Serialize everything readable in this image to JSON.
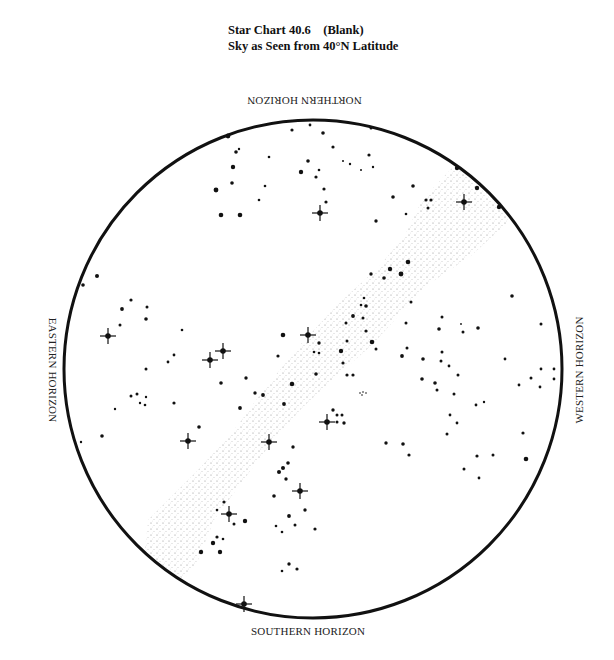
{
  "title": {
    "line1": "Star Chart 40.6    (Blank)",
    "line2": "Sky as Seen from 40°N Latitude"
  },
  "horizons": {
    "north": "NORTHERN HORIZON",
    "south": "SOUTHERN HORIZON",
    "east": "EASTERN HORIZON",
    "west": "WESTERN HORIZON"
  },
  "colors": {
    "ink": "#111111",
    "milky_way": "#9a9a9a",
    "background": "#ffffff"
  },
  "chart_data": {
    "type": "scatter",
    "xlabel": "",
    "ylabel": "",
    "horizon_circle": {
      "cx": 313,
      "cy": 369,
      "r": 249
    },
    "labels": [
      "NORTHERN HORIZON",
      "SOUTHERN HORIZON",
      "EASTERN HORIZON",
      "WESTERN HORIZON"
    ],
    "milky_way_band": [
      [
        148,
        520
      ],
      [
        200,
        468
      ],
      [
        238,
        425
      ],
      [
        262,
        392
      ],
      [
        300,
        345
      ],
      [
        340,
        302
      ],
      [
        378,
        268
      ],
      [
        405,
        235
      ],
      [
        422,
        200
      ],
      [
        452,
        168
      ],
      [
        478,
        178
      ],
      [
        505,
        200
      ],
      [
        508,
        222
      ],
      [
        472,
        255
      ],
      [
        432,
        282
      ],
      [
        402,
        312
      ],
      [
        372,
        345
      ],
      [
        332,
        380
      ],
      [
        302,
        408
      ],
      [
        272,
        442
      ],
      [
        242,
        482
      ],
      [
        214,
        520
      ],
      [
        198,
        560
      ],
      [
        182,
        582
      ],
      [
        160,
        570
      ],
      [
        145,
        550
      ]
    ],
    "bright_stars": [
      [
        320,
        213
      ],
      [
        464,
        202
      ],
      [
        108,
        336
      ],
      [
        308,
        335
      ],
      [
        210,
        360
      ],
      [
        223,
        351
      ],
      [
        188,
        441
      ],
      [
        269,
        442
      ],
      [
        327,
        422
      ],
      [
        300,
        491
      ],
      [
        229,
        514
      ],
      [
        244,
        604
      ]
    ],
    "stars": [
      [
        228,
        136,
        2.4
      ],
      [
        292,
        130,
        1.6
      ],
      [
        310,
        125,
        1.4
      ],
      [
        323,
        133,
        1.8
      ],
      [
        371,
        128,
        1.5
      ],
      [
        236,
        152,
        1.8
      ],
      [
        239,
        149,
        1.2
      ],
      [
        269,
        157,
        1.3
      ],
      [
        308,
        161,
        1.8
      ],
      [
        233,
        167,
        2.2
      ],
      [
        301,
        172,
        2.2
      ],
      [
        319,
        170,
        1.3
      ],
      [
        316,
        177,
        1.6
      ],
      [
        333,
        147,
        1.6
      ],
      [
        343,
        161,
        1
      ],
      [
        350,
        164,
        1.2
      ],
      [
        369,
        155,
        1.6
      ],
      [
        373,
        167,
        1.2
      ],
      [
        361,
        170,
        1
      ],
      [
        232,
        183,
        1.8
      ],
      [
        216,
        190,
        2.4
      ],
      [
        265,
        186,
        1.3
      ],
      [
        324,
        189,
        1.6
      ],
      [
        259,
        200,
        1.3
      ],
      [
        326,
        202,
        1.6
      ],
      [
        221,
        215,
        2.3
      ],
      [
        240,
        215,
        2.3
      ],
      [
        376,
        221,
        1.7
      ],
      [
        393,
        197,
        1.8
      ],
      [
        413,
        186,
        1.8
      ],
      [
        426,
        200,
        1.6
      ],
      [
        431,
        200,
        1.6
      ],
      [
        428,
        208,
        1.5
      ],
      [
        406,
        214,
        1.3
      ],
      [
        457,
        168,
        2.2
      ],
      [
        477,
        188,
        2.2
      ],
      [
        499,
        207,
        2.2
      ],
      [
        408,
        262,
        2.3
      ],
      [
        390,
        269,
        2.2
      ],
      [
        401,
        274,
        2.4
      ],
      [
        371,
        274,
        1.7
      ],
      [
        384,
        278,
        1.8
      ],
      [
        411,
        302,
        1.5
      ],
      [
        364,
        298,
        1.3
      ],
      [
        361,
        305,
        1.3
      ],
      [
        366,
        306,
        1.8
      ],
      [
        353,
        316,
        1.9
      ],
      [
        363,
        318,
        1.5
      ],
      [
        346,
        323,
        1.5
      ],
      [
        366,
        331,
        1.6
      ],
      [
        406,
        323,
        1.5
      ],
      [
        372,
        342,
        2.3
      ],
      [
        376,
        349,
        1.5
      ],
      [
        347,
        341,
        1.5
      ],
      [
        341,
        351,
        2.2
      ],
      [
        319,
        343,
        1.7
      ],
      [
        314,
        352,
        1.3
      ],
      [
        319,
        353,
        1.3
      ],
      [
        343,
        363,
        1.6
      ],
      [
        316,
        374,
        1.8
      ],
      [
        347,
        375,
        1.6
      ],
      [
        353,
        375,
        1.6
      ],
      [
        283,
        335,
        2.3
      ],
      [
        278,
        356,
        1.6
      ],
      [
        292,
        384,
        2.3
      ],
      [
        255,
        393,
        1.7
      ],
      [
        263,
        395,
        1.9
      ],
      [
        284,
        404,
        1.9
      ],
      [
        240,
        408,
        1.9
      ],
      [
        246,
        378,
        1.7
      ],
      [
        97,
        276,
        2
      ],
      [
        83,
        285,
        1.8
      ],
      [
        131,
        300,
        1.6
      ],
      [
        122,
        309,
        1.9
      ],
      [
        147,
        307,
        1.5
      ],
      [
        146,
        319,
        1.8
      ],
      [
        120,
        325,
        1.5
      ],
      [
        182,
        330,
        1.3
      ],
      [
        174,
        355,
        1.4
      ],
      [
        168,
        362,
        1.4
      ],
      [
        146,
        369,
        1.5
      ],
      [
        221,
        383,
        1.8
      ],
      [
        131,
        396,
        1.5
      ],
      [
        137,
        394,
        1.5
      ],
      [
        146,
        397,
        1.2
      ],
      [
        140,
        403,
        1.2
      ],
      [
        145,
        405,
        1.3
      ],
      [
        174,
        403,
        1.6
      ],
      [
        115,
        409,
        1.2
      ],
      [
        102,
        436,
        1.8
      ],
      [
        81,
        442,
        1.2
      ],
      [
        199,
        427,
        1.8
      ],
      [
        293,
        447,
        1.7
      ],
      [
        333,
        410,
        1.7
      ],
      [
        337,
        415,
        1.5
      ],
      [
        342,
        415,
        1.5
      ],
      [
        337,
        422,
        1.5
      ],
      [
        344,
        423,
        1.7
      ],
      [
        360,
        393,
        0.8
      ],
      [
        363,
        392,
        0.8
      ],
      [
        366,
        393,
        0.8
      ],
      [
        362,
        395,
        0.8
      ],
      [
        288,
        463,
        1.8
      ],
      [
        283,
        468,
        2
      ],
      [
        279,
        472,
        2
      ],
      [
        286,
        479,
        1.7
      ],
      [
        274,
        496,
        1.8
      ],
      [
        305,
        510,
        1.7
      ],
      [
        289,
        516,
        1.9
      ],
      [
        276,
        526,
        1.3
      ],
      [
        282,
        532,
        1.3
      ],
      [
        295,
        525,
        1.5
      ],
      [
        315,
        529,
        1.6
      ],
      [
        289,
        564,
        1.7
      ],
      [
        282,
        571,
        1.3
      ],
      [
        297,
        569,
        1.6
      ],
      [
        224,
        502,
        1.6
      ],
      [
        217,
        510,
        1.3
      ],
      [
        245,
        521,
        2.2
      ],
      [
        234,
        524,
        1.5
      ],
      [
        217,
        537,
        1.6
      ],
      [
        223,
        539,
        1.3
      ],
      [
        213,
        543,
        2.2
      ],
      [
        201,
        552,
        2.2
      ],
      [
        220,
        552,
        2.2
      ],
      [
        512,
        296,
        1.8
      ],
      [
        541,
        324,
        1.5
      ],
      [
        478,
        328,
        1.8
      ],
      [
        442,
        317,
        1.5
      ],
      [
        439,
        329,
        1.8
      ],
      [
        463,
        332,
        1.5
      ],
      [
        461,
        324,
        0.9
      ],
      [
        407,
        348,
        1.5
      ],
      [
        402,
        356,
        1.9
      ],
      [
        423,
        359,
        1.8
      ],
      [
        442,
        352,
        1.5
      ],
      [
        441,
        361,
        1.5
      ],
      [
        449,
        366,
        1.4
      ],
      [
        458,
        375,
        1.5
      ],
      [
        505,
        359,
        1.4
      ],
      [
        531,
        378,
        1.5
      ],
      [
        541,
        369,
        1.4
      ],
      [
        554,
        369,
        1.4
      ],
      [
        554,
        379,
        1.4
      ],
      [
        540,
        387,
        1.4
      ],
      [
        519,
        385,
        1.4
      ],
      [
        422,
        379,
        1.8
      ],
      [
        435,
        383,
        1.8
      ],
      [
        437,
        390,
        1.5
      ],
      [
        454,
        394,
        1.5
      ],
      [
        476,
        405,
        1.4
      ],
      [
        484,
        402,
        1.2
      ],
      [
        450,
        415,
        1.4
      ],
      [
        457,
        423,
        1.4
      ],
      [
        447,
        434,
        1.5
      ],
      [
        523,
        433,
        1.6
      ],
      [
        386,
        443,
        1.7
      ],
      [
        403,
        444,
        1.8
      ],
      [
        409,
        455,
        1.6
      ],
      [
        477,
        456,
        1.6
      ],
      [
        493,
        455,
        1.5
      ],
      [
        526,
        459,
        2.3
      ],
      [
        464,
        469,
        1.5
      ],
      [
        479,
        478,
        1.4
      ]
    ]
  }
}
